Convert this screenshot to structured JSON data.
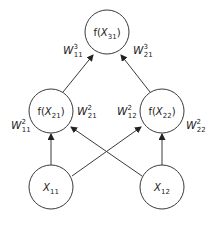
{
  "diagram": {
    "type": "neural-network",
    "nodes": [
      {
        "id": "x31",
        "prefix": "f(",
        "var": "X",
        "sub": "31",
        "suffix": ")",
        "cx": 107,
        "cy": 32,
        "r": 22
      },
      {
        "id": "x21",
        "prefix": "f(",
        "var": "X",
        "sub": "21",
        "suffix": ")",
        "cx": 51,
        "cy": 111,
        "r": 22
      },
      {
        "id": "x22",
        "prefix": "f(",
        "var": "X",
        "sub": "22",
        "suffix": ")",
        "cx": 162,
        "cy": 111,
        "r": 22
      },
      {
        "id": "x11",
        "prefix": "",
        "var": "X",
        "sub": "11",
        "suffix": "",
        "cx": 51,
        "cy": 187,
        "r": 22
      },
      {
        "id": "x12",
        "prefix": "",
        "var": "X",
        "sub": "12",
        "suffix": "",
        "cx": 162,
        "cy": 187,
        "r": 22
      }
    ],
    "edges": [
      {
        "from": "x21",
        "to": "x31",
        "weight": {
          "var": "W",
          "sup": "3",
          "sub": "11"
        }
      },
      {
        "from": "x22",
        "to": "x31",
        "weight": {
          "var": "W",
          "sup": "3",
          "sub": "21"
        }
      },
      {
        "from": "x11",
        "to": "x21",
        "weight": {
          "var": "W",
          "sup": "2",
          "sub": "11"
        }
      },
      {
        "from": "x12",
        "to": "x21",
        "weight": {
          "var": "W",
          "sup": "2",
          "sub": "21"
        }
      },
      {
        "from": "x11",
        "to": "x22",
        "weight": {
          "var": "W",
          "sup": "2",
          "sub": "12"
        }
      },
      {
        "from": "x12",
        "to": "x22",
        "weight": {
          "var": "W",
          "sup": "2",
          "sub": "22"
        }
      }
    ],
    "labels": {
      "x31": "f(X31)",
      "x21": "f(X21)",
      "x22": "f(X22)",
      "x11": "X11",
      "x12": "X12",
      "w3_11": "W^3_11",
      "w3_21": "W^3_21",
      "w2_11": "W^2_11",
      "w2_21": "W^2_21",
      "w2_12": "W^2_12",
      "w2_22": "W^2_22"
    },
    "colors": {
      "stroke": "#3a3a3a",
      "text": "#222222",
      "background": "#ffffff"
    }
  }
}
